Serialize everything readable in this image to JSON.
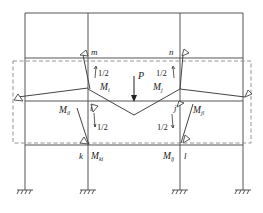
{
  "figure": {
    "title": "",
    "colors": {
      "line": "#555555",
      "dashed": "#888888",
      "text": "#222222"
    }
  },
  "labels": {
    "node_m": "m",
    "node_n": "n",
    "node_i": "i",
    "node_j": "j",
    "node_k": "k",
    "node_l": "l",
    "load_p": "P",
    "moment_Mi": "M",
    "moment_Mi_sub": "i",
    "moment_Mj": "M",
    "moment_Mj_sub": "j",
    "moment_Mil": "M",
    "moment_Mil_sub": "il",
    "moment_Mjl": "M",
    "moment_Mjl_sub": "jl",
    "moment_Mki": "M",
    "moment_Mki_sub": "ki",
    "moment_Mlj": "M",
    "moment_Mlj_sub": "lj",
    "half_upper_left": "1/2",
    "half_upper_right": "1/2",
    "half_lower_left": "1/2",
    "half_lower_right": "1/2"
  }
}
